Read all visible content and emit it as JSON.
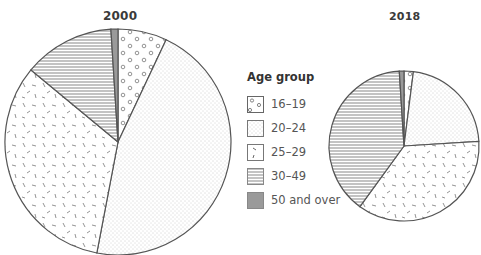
{
  "chart_data": [
    {
      "type": "pie",
      "title": "2000",
      "categories": [
        "16–19",
        "20–24",
        "25–29",
        "30–49",
        "50 and over"
      ],
      "values": [
        7,
        46,
        33,
        13,
        1
      ],
      "unit": "percent (estimated)",
      "start_angle": "12 o'clock, clockwise"
    },
    {
      "type": "pie",
      "title": "2018",
      "categories": [
        "16–19",
        "20–24",
        "25–29",
        "30–49",
        "50 and over"
      ],
      "values": [
        2,
        22,
        36,
        39,
        1
      ],
      "unit": "percent (estimated)",
      "start_angle": "12 o'clock, clockwise"
    }
  ],
  "titles": {
    "left": "2000",
    "right": "2018"
  },
  "legend": {
    "title": "Age group",
    "items": [
      {
        "label": "16–19",
        "pattern": "circles"
      },
      {
        "label": "20–24",
        "pattern": "fine-dots"
      },
      {
        "label": "25–29",
        "pattern": "dashes"
      },
      {
        "label": "30–49",
        "pattern": "horizontal-lines"
      },
      {
        "label": "50 and over",
        "pattern": "solid-gray"
      }
    ]
  },
  "colors": {
    "outline": "#555555",
    "solid_gray": "#9a9a9a",
    "hatch": "#777777",
    "dots": "#999999"
  }
}
